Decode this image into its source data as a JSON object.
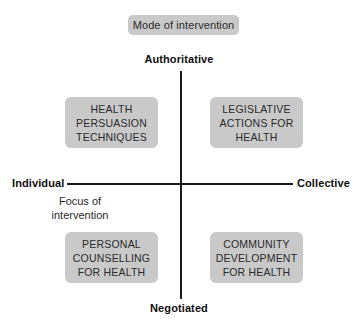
{
  "figure": {
    "title_pill": "Mode of intervention",
    "axes": {
      "vertical": {
        "top_pole": "Authoritative",
        "bottom_pole": "Negotiated"
      },
      "horizontal": {
        "left_pole": "Individual",
        "right_pole": "Collective",
        "caption_line1": "Focus of",
        "caption_line2": "intervention"
      }
    },
    "quadrants": [
      {
        "position": "top-left",
        "line1": "HEALTH",
        "line2": "PERSUASION",
        "line3": "TECHNIQUES"
      },
      {
        "position": "top-right",
        "line1": "LEGISLATIVE",
        "line2": "ACTIONS FOR",
        "line3": "HEALTH"
      },
      {
        "position": "bottom-left",
        "line1": "PERSONAL",
        "line2": "COUNSELLING",
        "line3": "FOR HEALTH"
      },
      {
        "position": "bottom-right",
        "line1": "COMMUNITY",
        "line2": "DEVELOPMENT",
        "line3": "FOR HEALTH"
      }
    ]
  },
  "colors": {
    "box_fill": "#c9c9c9",
    "axis_line": "#1b1b1b",
    "text_dark": "#2b2b2b",
    "background": "#ffffff"
  }
}
